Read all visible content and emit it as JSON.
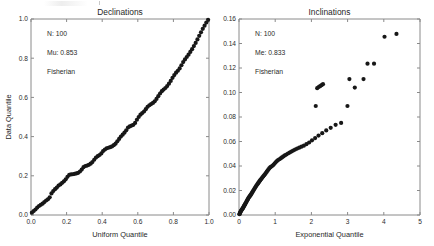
{
  "figure": {
    "width": 434,
    "height": 246,
    "background": "#ffffff",
    "marker_color": "#171717",
    "axis_color": "#8a8a8a"
  },
  "chart_data": [
    {
      "type": "scatter",
      "id": "declinations-qq",
      "title": "Declinations",
      "xlabel": "Uniform Quantile",
      "ylabel": "Data Quantile",
      "xlim": [
        0,
        1
      ],
      "ylim": [
        0,
        1
      ],
      "xticks": [
        0.0,
        0.2,
        0.4,
        0.6,
        0.8,
        1.0
      ],
      "xticklabels": [
        "0.0",
        "0.2",
        "0.4",
        "0.6",
        "0.8",
        "1.0"
      ],
      "yticks": [
        0.0,
        0.2,
        0.4,
        0.6,
        0.8,
        1.0
      ],
      "yticklabels": [
        "0.0",
        "0.2",
        "0.4",
        "0.6",
        "0.8",
        "1.0"
      ],
      "grid": false,
      "legend": "none",
      "annotations": [
        "N: 100",
        "Mu: 0.853",
        "Fisherian"
      ],
      "marker_size": 2.1,
      "x": [
        0.005,
        0.015,
        0.025,
        0.035,
        0.045,
        0.055,
        0.065,
        0.075,
        0.085,
        0.095,
        0.105,
        0.115,
        0.125,
        0.135,
        0.145,
        0.155,
        0.165,
        0.175,
        0.185,
        0.195,
        0.205,
        0.215,
        0.225,
        0.235,
        0.245,
        0.255,
        0.265,
        0.275,
        0.285,
        0.295,
        0.305,
        0.315,
        0.325,
        0.335,
        0.345,
        0.355,
        0.365,
        0.375,
        0.385,
        0.395,
        0.405,
        0.415,
        0.425,
        0.435,
        0.445,
        0.455,
        0.465,
        0.475,
        0.485,
        0.495,
        0.505,
        0.515,
        0.525,
        0.535,
        0.545,
        0.555,
        0.565,
        0.575,
        0.585,
        0.595,
        0.605,
        0.615,
        0.625,
        0.635,
        0.645,
        0.655,
        0.665,
        0.675,
        0.685,
        0.695,
        0.705,
        0.715,
        0.725,
        0.735,
        0.745,
        0.755,
        0.765,
        0.775,
        0.785,
        0.795,
        0.805,
        0.815,
        0.825,
        0.835,
        0.845,
        0.855,
        0.865,
        0.875,
        0.885,
        0.895,
        0.905,
        0.915,
        0.925,
        0.935,
        0.945,
        0.955,
        0.965,
        0.975,
        0.985,
        0.995
      ],
      "y": [
        0.012,
        0.02,
        0.028,
        0.038,
        0.046,
        0.052,
        0.058,
        0.066,
        0.074,
        0.08,
        0.09,
        0.11,
        0.122,
        0.132,
        0.14,
        0.15,
        0.156,
        0.164,
        0.172,
        0.182,
        0.195,
        0.205,
        0.207,
        0.208,
        0.21,
        0.212,
        0.215,
        0.222,
        0.232,
        0.244,
        0.25,
        0.252,
        0.256,
        0.262,
        0.27,
        0.282,
        0.293,
        0.3,
        0.306,
        0.314,
        0.326,
        0.334,
        0.34,
        0.343,
        0.346,
        0.35,
        0.356,
        0.364,
        0.376,
        0.388,
        0.4,
        0.41,
        0.42,
        0.432,
        0.446,
        0.452,
        0.456,
        0.46,
        0.47,
        0.486,
        0.5,
        0.512,
        0.52,
        0.528,
        0.54,
        0.552,
        0.56,
        0.566,
        0.572,
        0.58,
        0.592,
        0.606,
        0.62,
        0.632,
        0.64,
        0.648,
        0.658,
        0.67,
        0.684,
        0.7,
        0.714,
        0.726,
        0.736,
        0.748,
        0.764,
        0.78,
        0.794,
        0.806,
        0.818,
        0.832,
        0.846,
        0.862,
        0.878,
        0.896,
        0.914,
        0.932,
        0.95,
        0.966,
        0.982,
        0.996
      ]
    },
    {
      "type": "scatter",
      "id": "inclinations-qq",
      "title": "Inclinations",
      "xlabel": "Exponential Quantile",
      "ylabel": "",
      "xlim": [
        0,
        5
      ],
      "ylim": [
        0,
        0.16
      ],
      "xticks": [
        0,
        1,
        2,
        3,
        4,
        5
      ],
      "xticklabels": [
        "0",
        "1",
        "2",
        "3",
        "4",
        "5"
      ],
      "yticks": [
        0.0,
        0.02,
        0.04,
        0.06,
        0.08,
        0.1,
        0.12,
        0.14,
        0.16
      ],
      "yticklabels": [
        "0.00",
        "0.02",
        "0.04",
        "0.06",
        "0.08",
        "0.10",
        "0.12",
        "0.14",
        "0.16"
      ],
      "grid": false,
      "legend": "none",
      "annotations": [
        "N: 100",
        "Me: 0.833",
        "Fisherian"
      ],
      "marker_size": 2.1,
      "x": [
        0.01,
        0.02,
        0.03,
        0.041,
        0.051,
        0.062,
        0.073,
        0.084,
        0.095,
        0.106,
        0.118,
        0.129,
        0.141,
        0.153,
        0.165,
        0.178,
        0.19,
        0.203,
        0.216,
        0.229,
        0.242,
        0.256,
        0.27,
        0.284,
        0.298,
        0.313,
        0.327,
        0.342,
        0.358,
        0.373,
        0.389,
        0.405,
        0.422,
        0.439,
        0.456,
        0.473,
        0.491,
        0.51,
        0.528,
        0.547,
        0.567,
        0.587,
        0.607,
        0.628,
        0.649,
        0.671,
        0.693,
        0.716,
        0.74,
        0.764,
        0.788,
        0.814,
        0.84,
        0.867,
        0.894,
        0.923,
        0.952,
        0.982,
        1.013,
        1.046,
        1.079,
        1.114,
        1.15,
        1.187,
        1.225,
        1.266,
        1.308,
        1.352,
        1.398,
        1.446,
        1.496,
        1.549,
        1.605,
        1.664,
        1.726,
        1.792,
        1.862,
        1.937,
        2.017,
        2.104,
        2.197,
        2.299,
        2.41,
        2.533,
        2.669,
        2.821,
        2.996,
        3.199,
        3.44,
        3.73,
        2.12,
        2.16,
        2.2,
        2.24,
        2.28,
        2.32,
        3.05,
        3.55,
        4.02,
        4.35
      ],
      "y": [
        0.0006,
        0.0012,
        0.0019,
        0.0025,
        0.0031,
        0.0036,
        0.0041,
        0.0046,
        0.0051,
        0.0056,
        0.0062,
        0.0068,
        0.0074,
        0.008,
        0.0086,
        0.0093,
        0.01,
        0.0107,
        0.0114,
        0.0121,
        0.0128,
        0.0135,
        0.0142,
        0.0148,
        0.0154,
        0.016,
        0.0166,
        0.0173,
        0.018,
        0.0188,
        0.0196,
        0.0204,
        0.0212,
        0.022,
        0.0228,
        0.0236,
        0.0244,
        0.0252,
        0.026,
        0.0268,
        0.0276,
        0.0284,
        0.0292,
        0.03,
        0.0308,
        0.0316,
        0.0324,
        0.0332,
        0.0342,
        0.0352,
        0.0362,
        0.0372,
        0.0382,
        0.039,
        0.0396,
        0.0402,
        0.041,
        0.042,
        0.043,
        0.044,
        0.0448,
        0.0455,
        0.0462,
        0.047,
        0.0478,
        0.0486,
        0.0494,
        0.0502,
        0.051,
        0.0518,
        0.0526,
        0.0534,
        0.0542,
        0.055,
        0.0558,
        0.0566,
        0.0578,
        0.0592,
        0.061,
        0.0628,
        0.0648,
        0.0668,
        0.069,
        0.0712,
        0.0736,
        0.0752,
        0.089,
        0.104,
        0.111,
        0.1235,
        0.089,
        0.1035,
        0.1045,
        0.1052,
        0.106,
        0.1068,
        0.111,
        0.1235,
        0.1455,
        0.1478
      ]
    }
  ]
}
